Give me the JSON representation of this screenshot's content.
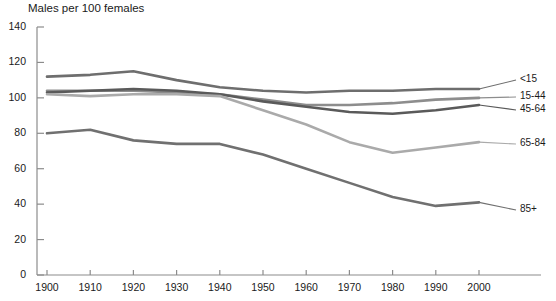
{
  "chart_data": {
    "type": "line",
    "title": "Males per 100 females",
    "xlabel": "",
    "ylabel": "",
    "ylim": [
      0,
      140
    ],
    "ytick_values": [
      0,
      20,
      40,
      60,
      80,
      100,
      120,
      140
    ],
    "ytick_labels": [
      "0",
      "20",
      "40",
      "60",
      "80",
      "100",
      "120",
      "140"
    ],
    "grid": false,
    "legend_position": "right-inline",
    "x": [
      1900,
      1910,
      1920,
      1930,
      1940,
      1950,
      1960,
      1970,
      1980,
      1990,
      2000
    ],
    "xtick_labels": [
      "1900",
      "1910",
      "1920",
      "1930",
      "1940",
      "1950",
      "1960",
      "1970",
      "1980",
      "1990",
      "2000"
    ],
    "series": [
      {
        "name": "<15",
        "label": "<15",
        "color": "#6e6e6e",
        "values": [
          112,
          113,
          115,
          110,
          106,
          104,
          103,
          104,
          104,
          105,
          105
        ]
      },
      {
        "name": "15-44",
        "label": "15-44",
        "color": "#8d8d8d",
        "values": [
          104,
          104,
          104,
          103,
          102,
          99,
          96,
          96,
          97,
          99,
          100
        ]
      },
      {
        "name": "45-64",
        "label": "45-64",
        "color": "#5a5a5a",
        "values": [
          103,
          104,
          105,
          104,
          102,
          98,
          95,
          92,
          91,
          93,
          96
        ]
      },
      {
        "name": "65-84",
        "label": "65-84",
        "color": "#aaaaaa",
        "values": [
          102,
          101,
          102,
          102,
          101,
          93,
          85,
          75,
          69,
          72,
          75
        ]
      },
      {
        "name": "85+",
        "label": "85+",
        "color": "#707070",
        "values": [
          80,
          82,
          76,
          74,
          74,
          68,
          60,
          52,
          44,
          39,
          41
        ]
      }
    ]
  },
  "axis": {
    "color": "#8c8c8c"
  }
}
